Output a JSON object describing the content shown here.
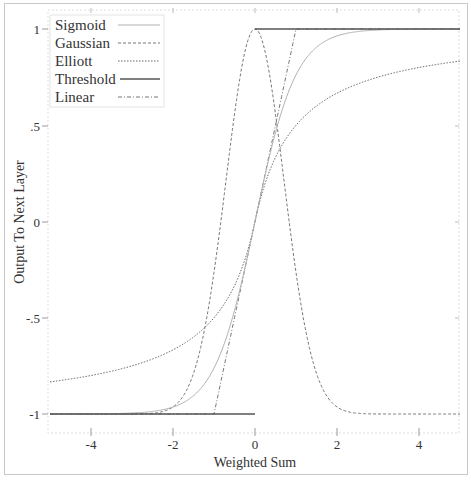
{
  "chart_data": {
    "type": "line",
    "title": "",
    "xlabel": "Weighted Sum",
    "ylabel": "Output To Next Layer",
    "xlim": [
      -5,
      5
    ],
    "ylim": [
      -1,
      1
    ],
    "grid": false,
    "legend_position": "upper left",
    "x_ticks": [
      -4,
      -2,
      0,
      2,
      4
    ],
    "x_tick_labels": [
      "-4",
      "-2",
      "0",
      "2",
      "4"
    ],
    "y_ticks": [
      1,
      0.5,
      0,
      -0.5,
      -1
    ],
    "y_tick_labels": [
      "1",
      ".5",
      "0",
      "-.5",
      "-1"
    ],
    "series": [
      {
        "name": "Sigmoid",
        "style": "solid-light",
        "color": "#aaaaaa",
        "function": "tanh(x)",
        "x": [
          -5,
          -4,
          -3,
          -2,
          -1,
          0,
          1,
          2,
          3,
          4,
          5
        ],
        "values": [
          -1.0,
          -1.0,
          -0.99,
          -0.96,
          -0.76,
          0,
          0.76,
          0.96,
          0.99,
          1.0,
          1.0
        ]
      },
      {
        "name": "Gaussian",
        "style": "dashed",
        "color": "#777777",
        "function": "2*exp(-x^2)-1",
        "x": [
          -5,
          -3,
          -2,
          -1.5,
          -1,
          -0.5,
          0,
          0.5,
          1,
          1.5,
          2,
          3,
          5
        ],
        "values": [
          -1,
          -1,
          -0.96,
          -0.79,
          -0.26,
          0.56,
          1,
          0.56,
          -0.26,
          -0.79,
          -0.96,
          -1,
          -1
        ]
      },
      {
        "name": "Elliott",
        "style": "dotted",
        "color": "#777777",
        "function": "x/(1+|x|)",
        "x": [
          -5,
          -4,
          -3,
          -2,
          -1,
          0,
          1,
          2,
          3,
          4,
          5
        ],
        "values": [
          -0.83,
          -0.8,
          -0.75,
          -0.67,
          -0.5,
          0,
          0.5,
          0.67,
          0.75,
          0.8,
          0.83
        ]
      },
      {
        "name": "Threshold",
        "style": "solid-dark",
        "color": "#555555",
        "function": "sign(x)",
        "x": [
          -5,
          0,
          0,
          5
        ],
        "values": [
          -1,
          -1,
          1,
          1
        ]
      },
      {
        "name": "Linear",
        "style": "dash-dot",
        "color": "#777777",
        "function": "clip(x,-1,1)",
        "x": [
          -5,
          -1,
          1,
          5
        ],
        "values": [
          -1,
          -1,
          1,
          1
        ]
      }
    ]
  },
  "axes": {
    "xlabel": "Weighted Sum",
    "ylabel": "Output To Next Layer",
    "x_tick_labels": [
      "-4",
      "-2",
      "0",
      "2",
      "4"
    ],
    "y_tick_labels": [
      "1",
      ".5",
      "0",
      "-.5",
      "-1"
    ]
  },
  "legend": {
    "items": [
      "Sigmoid",
      "Gaussian",
      "Elliott",
      "Threshold",
      "Linear"
    ]
  }
}
